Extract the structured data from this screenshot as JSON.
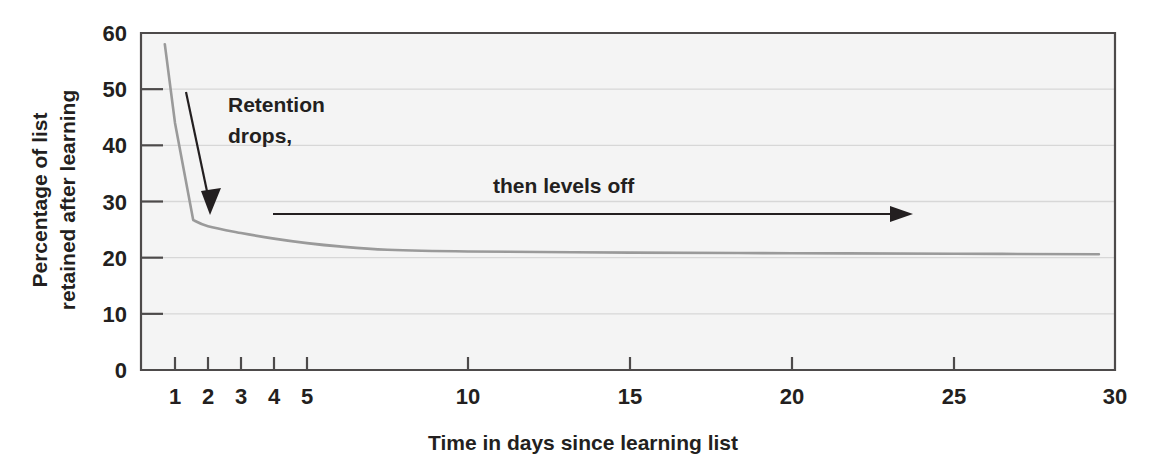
{
  "chart_data": {
    "type": "line",
    "title": "",
    "xlabel": "Time in days since learning list",
    "ylabel": "Percentage of list retained after learning",
    "ylabel_line1": "Percentage of list",
    "ylabel_line2": "retained after learning",
    "xlim": [
      0,
      30
    ],
    "ylim": [
      0,
      60
    ],
    "grid": true,
    "legend": null,
    "x_scale": "compressed-early-days",
    "x_ticks": [
      {
        "value": 1,
        "label": "1",
        "px": 175
      },
      {
        "value": 2,
        "label": "2",
        "px": 208
      },
      {
        "value": 3,
        "label": "3",
        "px": 241
      },
      {
        "value": 4,
        "label": "4",
        "px": 274
      },
      {
        "value": 5,
        "label": "5",
        "px": 307
      },
      {
        "value": 10,
        "label": "10",
        "px": 468
      },
      {
        "value": 15,
        "label": "15",
        "px": 630
      },
      {
        "value": 20,
        "label": "20",
        "px": 792
      },
      {
        "value": 25,
        "label": "25",
        "px": 954
      },
      {
        "value": 30,
        "label": "30",
        "px": 1115
      }
    ],
    "y_ticks": [
      {
        "value": 0,
        "label": "0"
      },
      {
        "value": 10,
        "label": "10"
      },
      {
        "value": 20,
        "label": "20"
      },
      {
        "value": 30,
        "label": "30"
      },
      {
        "value": 40,
        "label": "40"
      },
      {
        "value": 50,
        "label": "50"
      },
      {
        "value": 60,
        "label": "60"
      }
    ],
    "series": [
      {
        "name": "Percentage of list retained",
        "color": "#9a9a9a",
        "points": [
          {
            "days": 0.7,
            "percent": 58.0
          },
          {
            "days": 1.0,
            "percent": 44.0
          },
          {
            "days": 1.55,
            "percent": 26.7
          },
          {
            "days": 2.0,
            "percent": 25.6
          },
          {
            "days": 3.0,
            "percent": 24.4
          },
          {
            "days": 4.0,
            "percent": 23.4
          },
          {
            "days": 5.0,
            "percent": 22.6
          },
          {
            "days": 6.0,
            "percent": 22.0
          },
          {
            "days": 7.5,
            "percent": 21.4
          },
          {
            "days": 10.0,
            "percent": 21.1
          },
          {
            "days": 15.0,
            "percent": 20.9
          },
          {
            "days": 20.0,
            "percent": 20.8
          },
          {
            "days": 25.0,
            "percent": 20.7
          },
          {
            "days": 29.5,
            "percent": 20.6
          }
        ]
      }
    ],
    "annotations": [
      {
        "id": "retention-drops",
        "text_line1": "Retention",
        "text_line2": "drops,",
        "arrow": "down"
      },
      {
        "id": "levels-off",
        "text": "then levels off",
        "arrow": "right"
      }
    ]
  },
  "colors": {
    "curve": "#9a9a9a",
    "frame": "#4d4a4a",
    "grid": "#d7d7d7",
    "text": "#231f20",
    "plot_bg": "#f4f4f4"
  }
}
